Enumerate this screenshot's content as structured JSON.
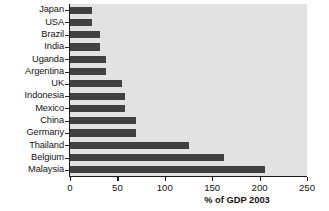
{
  "chart_data": {
    "type": "bar",
    "orientation": "horizontal",
    "title": "",
    "subtitle": "",
    "xlabel": "% of GDP 2003",
    "ylabel": "",
    "xlim": [
      0,
      250
    ],
    "xticks": [
      0,
      50,
      100,
      150,
      200,
      250
    ],
    "xtick_labels": [
      "0",
      "50",
      "100",
      "150",
      "200",
      "250"
    ],
    "grid": false,
    "legend": null,
    "legend_position": "none",
    "categories": [
      "Japan",
      "USA",
      "Brazil",
      "India",
      "Uganda",
      "Argentina",
      "UK",
      "Indonesia",
      "Mexico",
      "China",
      "Germany",
      "Thailand",
      "Belgium",
      "Malaysia"
    ],
    "values": [
      23,
      23,
      32,
      32,
      38,
      38,
      55,
      58,
      58,
      70,
      70,
      125,
      162,
      206
    ],
    "series": [
      {
        "name": "% of GDP 2003",
        "values": [
          23,
          23,
          32,
          32,
          38,
          38,
          55,
          58,
          58,
          70,
          70,
          125,
          162,
          206
        ]
      }
    ]
  },
  "style": {
    "bar_color": "#414141",
    "plot_background": "#e2e2e2",
    "page_background": "#ffffff",
    "axis_color": "#1b1b1b",
    "text_color": "#131313"
  }
}
